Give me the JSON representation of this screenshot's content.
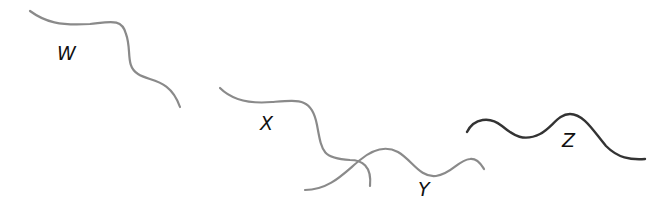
{
  "diagram": {
    "strands": [
      {
        "id": "W",
        "label": "W",
        "color": "#8a8a8a",
        "path": "M30,11 C45,22 60,26 90,24 C110,22 122,18 126,34 C132,50 125,66 138,74 C150,82 170,78 180,107",
        "label_pos": [
          57,
          60
        ]
      },
      {
        "id": "X",
        "label": "X",
        "color": "#8a8a8a",
        "path": "M220,88 C232,100 250,104 272,102 C300,100 312,98 317,125 C322,152 322,158 350,160 C362,160 372,166 370,186",
        "label_pos": [
          260,
          130
        ]
      },
      {
        "id": "Y",
        "label": "Y",
        "color": "#8a8a8a",
        "path": "M305,190 C330,190 345,172 360,160 C372,150 385,145 398,152 C412,160 420,178 436,176 C452,174 458,160 470,159 C478,158 482,166 484,169",
        "label_pos": [
          418,
          196
        ]
      },
      {
        "id": "Z",
        "label": "Z",
        "color": "#333333",
        "path": "M467,132 C474,118 490,116 502,126 C514,136 524,142 540,134 C552,128 558,114 570,114 C584,114 594,132 606,146 C618,158 630,160 645,159",
        "label_pos": [
          562,
          147
        ]
      }
    ]
  }
}
